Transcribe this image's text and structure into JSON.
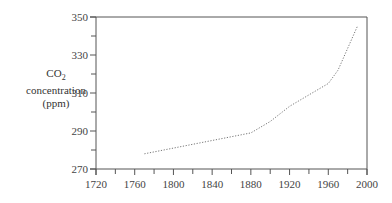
{
  "chart_data": {
    "type": "line",
    "title": "",
    "xlabel": "",
    "ylabel": "CO2 concentration (ppm)",
    "ylabel_parts": {
      "line1_main": "CO",
      "line1_sub": "2",
      "line2": "concentration",
      "line3": "(ppm)"
    },
    "xlim": [
      1720,
      2000
    ],
    "ylim": [
      270,
      350
    ],
    "x_ticks": [
      1720,
      1760,
      1800,
      1840,
      1880,
      1920,
      1960,
      2000
    ],
    "x_minor_ticks": [
      1740,
      1780,
      1820,
      1860,
      1900,
      1940,
      1980
    ],
    "y_ticks": [
      270,
      290,
      310,
      330,
      350
    ],
    "y_minor_ticks": [
      280,
      300,
      320,
      340
    ],
    "grid": false,
    "legend": null,
    "line_style": "dotted",
    "series": [
      {
        "name": "CO2 concentration",
        "x": [
          1770,
          1800,
          1840,
          1880,
          1900,
          1920,
          1940,
          1960,
          1970,
          1990
        ],
        "values": [
          278,
          281,
          285,
          289,
          295,
          303,
          309,
          315,
          322,
          345
        ]
      }
    ]
  }
}
